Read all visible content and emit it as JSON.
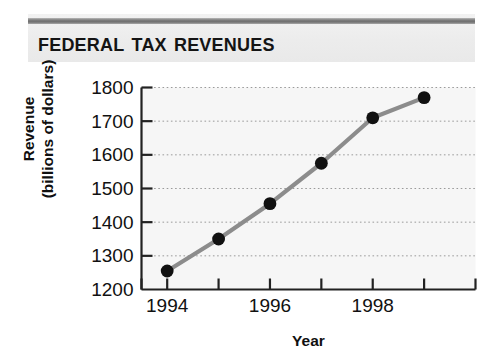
{
  "header": {
    "title": "Federal Tax Revenues",
    "rule_color": "#7d7d7d",
    "band_color": "#ececec"
  },
  "axis": {
    "y_title_line1": "Revenue",
    "y_title_line2": "(billions of dollars)",
    "x_title": "Year"
  },
  "chart_data": {
    "type": "line",
    "title": "Federal Tax Revenues",
    "xlabel": "Year",
    "ylabel": "Revenue (billions of dollars)",
    "x": [
      1994,
      1995,
      1996,
      1997,
      1998,
      1999
    ],
    "values": [
      1255,
      1350,
      1455,
      1575,
      1710,
      1770
    ],
    "series": [
      {
        "name": "Federal tax revenues",
        "values": [
          1255,
          1350,
          1455,
          1575,
          1710,
          1770
        ]
      }
    ],
    "xlim": [
      1993.5,
      2000
    ],
    "ylim": [
      1200,
      1800
    ],
    "x_ticks": [
      1993.5,
      1994,
      1995,
      1996,
      1997,
      1998,
      1999,
      2000
    ],
    "x_tick_labels": [
      "",
      "1994",
      "",
      "1996",
      "",
      "1998",
      "",
      ""
    ],
    "y_ticks": [
      1200,
      1300,
      1400,
      1500,
      1600,
      1700,
      1800
    ],
    "y_tick_labels": [
      "1200",
      "1300",
      "1400",
      "1500",
      "1600",
      "1700",
      "1800"
    ],
    "grid": "horizontal-dotted",
    "legend": "none",
    "line_color": "#8c8c8c",
    "marker_color": "#111111",
    "plot_background": "#f6f6f6",
    "axis_color": "#222222"
  }
}
